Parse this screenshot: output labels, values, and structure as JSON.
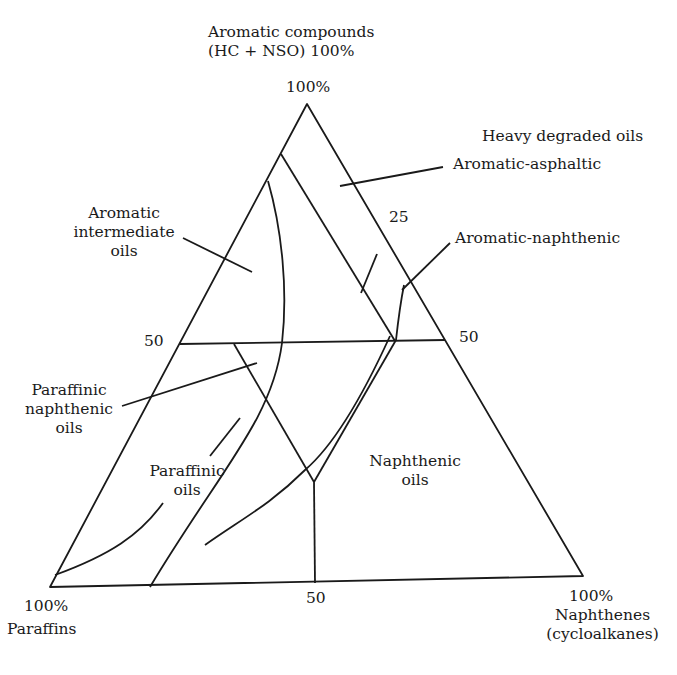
{
  "diagram": {
    "type": "ternary",
    "vertices": {
      "top": {
        "title_line1": "Aromatic compounds",
        "title_line2": "(HC + NSO) 100%",
        "value": "100%"
      },
      "left": {
        "value": "100%",
        "title": "Paraffins"
      },
      "right": {
        "value": "100%",
        "title_line1": "Naphthenes",
        "title_line2": "(cycloalkanes)"
      }
    },
    "ticks": {
      "left_50": "50",
      "right_50": "50",
      "right_25": "25",
      "bottom_50": "50"
    },
    "regions": {
      "heavy_degraded": "Heavy degraded oils",
      "aromatic_asphaltic": "Aromatic-asphaltic",
      "aromatic_naphthenic": "Aromatic-naphthenic",
      "aromatic_intermediate": [
        "Aromatic",
        "intermediate",
        "oils"
      ],
      "paraffinic_naphthenic": [
        "Paraffinic",
        "naphthenic",
        "oils"
      ],
      "paraffinic": [
        "Paraffinic",
        "oils"
      ],
      "naphthenic": [
        "Naphthenic",
        "oils"
      ]
    },
    "colors": {
      "line": "#1a1a1a",
      "background": "#ffffff"
    }
  }
}
